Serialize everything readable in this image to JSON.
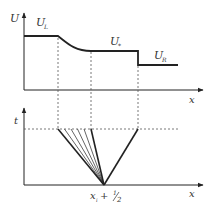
{
  "diagram": {
    "colors": {
      "line": "#222222",
      "dashed": "#555555",
      "text": "#333333",
      "background": "#ffffff"
    },
    "top_plot": {
      "y_axis_label": "U",
      "x_axis_label": "x",
      "states": [
        {
          "name": "left-state",
          "base": "U",
          "subscript": "L"
        },
        {
          "name": "star-state",
          "base": "U",
          "subscript": "*"
        },
        {
          "name": "right-state",
          "base": "U",
          "subscript": "R"
        }
      ]
    },
    "bottom_plot": {
      "y_axis_label": "t",
      "x_axis_label": "x",
      "origin_label": {
        "base": "x",
        "subscript": "i",
        "suffix": " + ",
        "fraction_num": "1",
        "fraction_den": "2"
      },
      "fan_thin_rays": 4
    }
  }
}
